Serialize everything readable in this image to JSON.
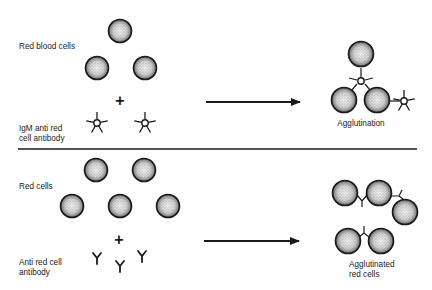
{
  "top_panel": {
    "label_cells": "Red blood cells",
    "label_antibody_line1": "IgM anti red",
    "label_antibody_line2": "cell antibody",
    "plus": "+",
    "result_label": "Agglutination"
  },
  "bottom_panel": {
    "label_cells": "Red cells",
    "label_antibody_line1": "Anti red cell",
    "label_antibody_line2": "antibody",
    "plus": "+",
    "result_label_line1": "Agglutinated",
    "result_label_line2": "red cells"
  },
  "colors": {
    "ink": "#1a1a1a",
    "cell_fill": "#d9d9d9",
    "background": "#ffffff"
  }
}
